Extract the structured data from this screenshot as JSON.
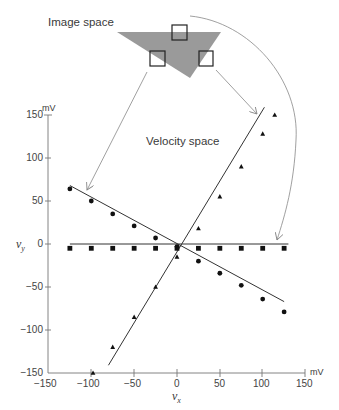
{
  "labels": {
    "image_space": "Image space",
    "velocity_space": "Velocity space",
    "y_axis_symbol": "vy",
    "x_axis_symbol": "vx",
    "y_unit": "mV",
    "x_unit": "mV"
  },
  "y_ticks": [
    "150",
    "100",
    "50",
    "0",
    "−50",
    "−100",
    "−150"
  ],
  "x_ticks": [
    "−150",
    "−100",
    "−50",
    "0",
    "50",
    "100",
    "150"
  ],
  "colors": {
    "triangle_fill": "#9a9a9a",
    "axis": "#777777",
    "line": "#333333",
    "marker": "#111111",
    "arrow": "#888888"
  },
  "chart_data": {
    "type": "scatter",
    "title": "Velocity space",
    "xlabel": "vx (mV)",
    "ylabel": "vy (mV)",
    "xlim": [
      -150,
      150
    ],
    "ylim": [
      -150,
      150
    ],
    "grid": false,
    "x_ticks": [
      -150,
      -100,
      -50,
      0,
      50,
      100,
      150
    ],
    "y_ticks": [
      -150,
      -100,
      -50,
      0,
      50,
      100,
      150
    ],
    "series": [
      {
        "name": "circles (left box)",
        "marker": "circle",
        "points": [
          [
            -125,
            64
          ],
          [
            -100,
            50
          ],
          [
            -75,
            35
          ],
          [
            -50,
            21
          ],
          [
            -25,
            7
          ],
          [
            0,
            -3
          ],
          [
            25,
            -20
          ],
          [
            50,
            -34
          ],
          [
            75,
            -48
          ],
          [
            100,
            -64
          ],
          [
            125,
            -79
          ]
        ],
        "fit_line": [
          [
            -125,
            68
          ],
          [
            125,
            -67
          ]
        ]
      },
      {
        "name": "squares (top box)",
        "marker": "square",
        "points": [
          [
            -125,
            -5
          ],
          [
            -100,
            -5
          ],
          [
            -75,
            -5
          ],
          [
            -50,
            -5
          ],
          [
            -25,
            -5
          ],
          [
            0,
            -5
          ],
          [
            25,
            -5
          ],
          [
            50,
            -5
          ],
          [
            75,
            -5
          ],
          [
            100,
            -5
          ],
          [
            125,
            -5
          ]
        ],
        "fit_line": [
          [
            -125,
            0
          ],
          [
            130,
            0
          ]
        ]
      },
      {
        "name": "triangles (right box)",
        "marker": "triangle",
        "points": [
          [
            -98,
            -150
          ],
          [
            -75,
            -120
          ],
          [
            -50,
            -85
          ],
          [
            -25,
            -50
          ],
          [
            0,
            -15
          ],
          [
            25,
            18
          ],
          [
            50,
            55
          ],
          [
            75,
            90
          ],
          [
            100,
            128
          ],
          [
            114,
            150
          ]
        ],
        "fit_line": [
          [
            -80,
            -141
          ],
          [
            102,
            159
          ]
        ]
      }
    ],
    "annotations": [
      "Image space",
      "Velocity space"
    ]
  }
}
